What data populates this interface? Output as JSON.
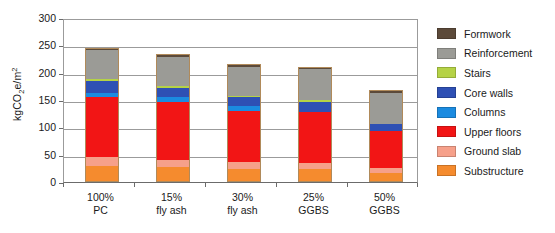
{
  "chart_data": {
    "type": "bar",
    "subtype": "stacked-bar",
    "title": "",
    "xlabel": "",
    "ylabel": "kgCO2e/m2",
    "ylabel_display": "kgCO₂e/m²",
    "ylim": [
      0,
      300
    ],
    "yticks": [
      0,
      50,
      100,
      150,
      200,
      250,
      300
    ],
    "ytick_labels": [
      "0",
      "50",
      "100",
      "150",
      "200",
      "250",
      "300"
    ],
    "grid": true,
    "grid_axis": "y",
    "legend_position": "right",
    "categories": [
      "100% PC",
      "15% fly ash",
      "30% fly ash",
      "25% GGBS",
      "50% GGBS"
    ],
    "category_lines": [
      [
        "100%",
        "PC"
      ],
      [
        "15%",
        "fly ash"
      ],
      [
        "30%",
        "fly ash"
      ],
      [
        "25%",
        "GGBS"
      ],
      [
        "50%",
        "GGBS"
      ]
    ],
    "series": [
      {
        "name": "Substructure",
        "color": "#F58B2E",
        "values": [
          30,
          27,
          24,
          23,
          16
        ]
      },
      {
        "name": "Ground slab",
        "color": "#F6A08A",
        "values": [
          15,
          14,
          13,
          12,
          9
        ]
      },
      {
        "name": "Upper floors",
        "color": "#F21515",
        "values": [
          111,
          105,
          93,
          93,
          69
        ]
      },
      {
        "name": "Columns",
        "color": "#1B8BE0",
        "values": [
          7,
          10,
          9,
          0,
          0
        ]
      },
      {
        "name": "Core walls",
        "color": "#2E50B4",
        "values": [
          22,
          16,
          16,
          19,
          13
        ]
      },
      {
        "name": "Stairs",
        "color": "#B5D246",
        "values": [
          3,
          3,
          3,
          3,
          0
        ]
      },
      {
        "name": "Reinforcement",
        "color": "#9B9B96",
        "values": [
          53,
          53,
          53,
          56,
          56
        ]
      },
      {
        "name": "Formwork",
        "color": "#5C4A3A",
        "values": [
          5,
          6,
          4,
          5,
          6
        ]
      }
    ],
    "totals": [
      246,
      234,
      215,
      211,
      169
    ],
    "stack_order_bottom_to_top": [
      "Substructure",
      "Ground slab",
      "Upper floors",
      "Columns",
      "Core walls",
      "Stairs",
      "Reinforcement",
      "Formwork"
    ],
    "legend_order_top_to_bottom": [
      "Formwork",
      "Reinforcement",
      "Stairs",
      "Core walls",
      "Columns",
      "Upper floors",
      "Ground slab",
      "Substructure"
    ]
  },
  "legend": {
    "items": [
      {
        "label": "Formwork",
        "color": "#5C4A3A"
      },
      {
        "label": "Reinforcement",
        "color": "#9B9B96"
      },
      {
        "label": "Stairs",
        "color": "#B5D246"
      },
      {
        "label": "Core walls",
        "color": "#2E50B4"
      },
      {
        "label": "Columns",
        "color": "#1B8BE0"
      },
      {
        "label": "Upper floors",
        "color": "#F21515"
      },
      {
        "label": "Ground slab",
        "color": "#F6A08A"
      },
      {
        "label": "Substructure",
        "color": "#F58B2E"
      }
    ]
  },
  "axes": {
    "y_title_main": "kgCO",
    "y_title_sub": "2",
    "y_title_mid": "e/m",
    "y_title_sup": "2"
  }
}
